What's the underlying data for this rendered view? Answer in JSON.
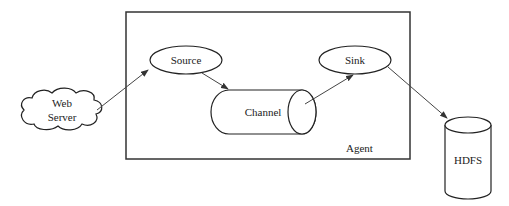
{
  "diagram": {
    "agent": {
      "label": "Agent"
    },
    "web_server": {
      "line1": "Web",
      "line2": "Server"
    },
    "source": {
      "label": "Source"
    },
    "channel": {
      "label": "Channel"
    },
    "sink": {
      "label": "Sink"
    },
    "hdfs": {
      "label": "HDFS"
    },
    "edges": [
      {
        "from": "Web Server",
        "to": "Source"
      },
      {
        "from": "Source",
        "to": "Channel"
      },
      {
        "from": "Channel",
        "to": "Sink"
      },
      {
        "from": "Sink",
        "to": "HDFS"
      }
    ],
    "colors": {
      "stroke": "#222222",
      "background": "#ffffff"
    }
  }
}
